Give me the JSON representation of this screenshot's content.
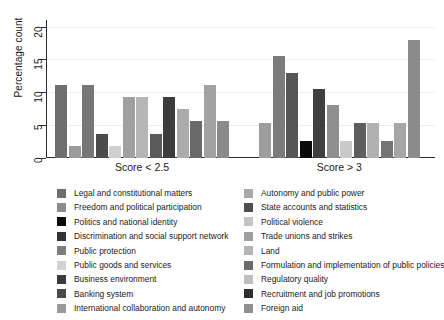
{
  "chart_data": {
    "type": "bar",
    "title": "",
    "xlabel": "",
    "ylabel": "Percentage count",
    "ylim": [
      0,
      21
    ],
    "yticks": [
      0,
      5,
      10,
      15,
      20
    ],
    "grid": true,
    "legend_position": "bottom",
    "categories": [
      "Score < 2.5",
      "Score > 3"
    ],
    "series": [
      {
        "name": "Legal and constitutional matters",
        "color": "#6e6e6e",
        "values": [
          11.1,
          0
        ]
      },
      {
        "name": "Freedom and political participation",
        "color": "#8c8c8c",
        "values": [
          1.85,
          0
        ]
      },
      {
        "name": "Politics and national identity",
        "color": "#0a0a0a",
        "values": [
          0,
          2.6
        ]
      },
      {
        "name": "Discrimination and social support network",
        "color": "#3a3a3a",
        "values": [
          11.1,
          0
        ]
      },
      {
        "name": "Public protection",
        "color": "#7d7d7d",
        "values": [
          3.7,
          0
        ]
      },
      {
        "name": "Public goods and services",
        "color": "#d2d2d2",
        "values": [
          0,
          0
        ]
      },
      {
        "name": "Business environment",
        "color": "#333333",
        "values": [
          0,
          0
        ]
      },
      {
        "name": "Banking system",
        "color": "#4a4a4a",
        "values": [
          0,
          0
        ]
      },
      {
        "name": "International collaboration and autonomy",
        "color": "#9a9a9a",
        "values": [
          1.85,
          0
        ]
      },
      {
        "name": "Autonomy and public power",
        "color": "#a8a8a8",
        "values": [
          9.3,
          5.3
        ]
      },
      {
        "name": "State accounts and statistics",
        "color": "#4f4f4f",
        "values": [
          0,
          13.0
        ]
      },
      {
        "name": "Political violence",
        "color": "#c4c4c4",
        "values": [
          9.3,
          0
        ]
      },
      {
        "name": "Trade unions and strikes",
        "color": "#9f9f9f",
        "values": [
          0,
          15.5
        ]
      },
      {
        "name": "Land",
        "color": "#b5b5b5",
        "values": [
          0,
          0
        ]
      },
      {
        "name": "Formulation and implementation of public policies",
        "color": "#6b6b6b",
        "values": [
          3.7,
          0
        ]
      },
      {
        "name": "Regulatory quality",
        "color": "#bfbfbf",
        "values": [
          0,
          8.0
        ]
      },
      {
        "name": "Recruitment and job promotions",
        "color": "#2e2e2e",
        "values": [
          9.3,
          10.5
        ]
      },
      {
        "name": "Foreign aid",
        "color": "#8f8f8f",
        "values": [
          7.4,
          0
        ]
      }
    ],
    "bars": [
      {
        "group": "Score < 2.5",
        "label": "Legal and constitutional matters",
        "value": 11.1,
        "color": "#6e6e6e"
      },
      {
        "group": "Score < 2.5",
        "label": "Freedom and political participation",
        "value": 1.85,
        "color": "#9a9a9a"
      },
      {
        "group": "Score < 2.5",
        "label": "Discrimination and social support network",
        "value": 11.1,
        "color": "#767676"
      },
      {
        "group": "Score < 2.5",
        "label": "Public protection",
        "value": 3.7,
        "color": "#4b4b4b"
      },
      {
        "group": "Score < 2.5",
        "label": "Public goods and services",
        "value": 1.85,
        "color": "#d0d0d0"
      },
      {
        "group": "Score < 2.5",
        "label": "Business environment",
        "value": 9.3,
        "color": "#a0a0a0"
      },
      {
        "group": "Score < 2.5",
        "label": "Banking system",
        "value": 9.3,
        "color": "#b6b6b6"
      },
      {
        "group": "Score < 2.5",
        "label": "International collaboration and autonomy",
        "value": 3.7,
        "color": "#5a5a5a"
      },
      {
        "group": "Score < 2.5",
        "label": "Autonomy and public power",
        "value": 9.3,
        "color": "#3c3c3c"
      },
      {
        "group": "Score < 2.5",
        "label": "State accounts and statistics",
        "value": 7.4,
        "color": "#acacac"
      },
      {
        "group": "Score < 2.5",
        "label": "Political violence",
        "value": 5.6,
        "color": "#6a6a6a"
      },
      {
        "group": "Score < 2.5",
        "label": "Trade unions and strikes",
        "value": 11.1,
        "color": "#a2a2a2"
      },
      {
        "group": "Score < 2.5",
        "label": "Land",
        "value": 5.6,
        "color": "#8a8a8a"
      },
      {
        "group": "Score > 3",
        "label": "Legal and constitutional matters",
        "value": 5.3,
        "color": "#9d9d9d"
      },
      {
        "group": "Score > 3",
        "label": "Freedom and political participation",
        "value": 15.5,
        "color": "#7c7c7c"
      },
      {
        "group": "Score > 3",
        "label": "Politics and national identity",
        "value": 13.0,
        "color": "#565656"
      },
      {
        "group": "Score > 3",
        "label": "Discrimination and social support network",
        "value": 2.6,
        "color": "#0a0a0a"
      },
      {
        "group": "Score > 3",
        "label": "Public protection",
        "value": 10.5,
        "color": "#3f3f3f"
      },
      {
        "group": "Score > 3",
        "label": "Public goods and services",
        "value": 8.0,
        "color": "#8f8f8f"
      },
      {
        "group": "Score > 3",
        "label": "Business environment",
        "value": 2.6,
        "color": "#c9c9c9"
      },
      {
        "group": "Score > 3",
        "label": "Banking system",
        "value": 5.3,
        "color": "#5e5e5e"
      },
      {
        "group": "Score > 3",
        "label": "International collaboration and autonomy",
        "value": 5.3,
        "color": "#b0b0b0"
      },
      {
        "group": "Score > 3",
        "label": "Autonomy and public power",
        "value": 2.6,
        "color": "#747474"
      },
      {
        "group": "Score > 3",
        "label": "State accounts and statistics",
        "value": 5.3,
        "color": "#a6a6a6"
      },
      {
        "group": "Score > 3",
        "label": "Foreign aid",
        "value": 18.0,
        "color": "#8b8b8b"
      }
    ]
  },
  "legend": {
    "left": [
      {
        "label": "Legal and constitutional matters",
        "color": "#6e6e6e"
      },
      {
        "label": "Freedom and political participation",
        "color": "#8c8c8c"
      },
      {
        "label": "Politics and national identity",
        "color": "#0a0a0a"
      },
      {
        "label": "Discrimination and social support network",
        "color": "#333333"
      },
      {
        "label": "Public protection",
        "color": "#7d7d7d"
      },
      {
        "label": "Public goods and services",
        "color": "#d2d2d2"
      },
      {
        "label": "Business environment",
        "color": "#3a3a3a"
      },
      {
        "label": "Banking system",
        "color": "#4a4a4a"
      },
      {
        "label": "International collaboration and autonomy",
        "color": "#9a9a9a"
      }
    ],
    "right": [
      {
        "label": "Autonomy and public power",
        "color": "#a8a8a8"
      },
      {
        "label": "State accounts and statistics",
        "color": "#4f4f4f"
      },
      {
        "label": "Political violence",
        "color": "#c4c4c4"
      },
      {
        "label": "Trade unions and strikes",
        "color": "#9f9f9f"
      },
      {
        "label": "Land",
        "color": "#b5b5b5"
      },
      {
        "label": "Formulation and implementation of public policies",
        "color": "#6b6b6b"
      },
      {
        "label": "Regulatory quality",
        "color": "#bfbfbf"
      },
      {
        "label": "Recruitment and job promotions",
        "color": "#2e2e2e"
      },
      {
        "label": "Foreign aid",
        "color": "#8f8f8f"
      }
    ]
  }
}
